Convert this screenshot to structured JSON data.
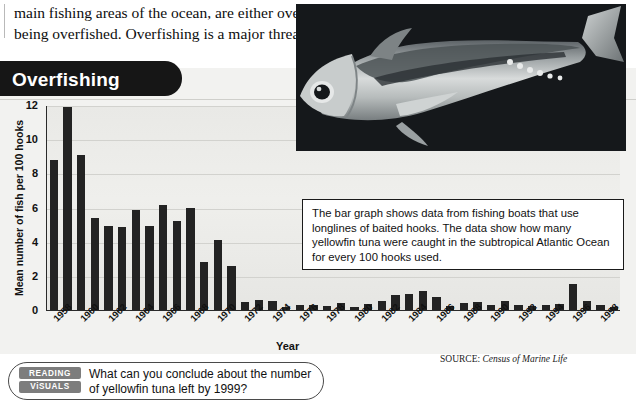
{
  "body_copy": {
    "line1": "main fishing areas of the ocean, are either overfished or very close to",
    "line2": "being overfished. Overfishing is a major threat to ocean environments."
  },
  "figure": {
    "title": "Overfishing",
    "callout": "The bar graph shows data from fishing boats that use longlines of baited hooks. The data show how many yellowfin tuna were caught in the subtropical Atlantic Ocean for every 100 hooks used.",
    "source_label": "SOURCE:",
    "source_value": "Census of Marine Life",
    "photo_alt": "yellowfin-tuna-photo"
  },
  "question": {
    "badge_line1": "READING",
    "badge_line2": "ViSUALS",
    "text": "What can you conclude about the number of yellowfin tuna left by 1999?"
  },
  "colors": {
    "bar": "#232323",
    "plot_bg": "#ebebe8",
    "tab": "#161616",
    "badge": "#7d7d7d"
  },
  "chart_data": {
    "type": "bar",
    "title": "Overfishing",
    "xlabel": "Year",
    "ylabel": "Mean number of fish per 100 hooks",
    "ylim": [
      0,
      12
    ],
    "yticks": [
      0,
      2,
      4,
      6,
      8,
      10,
      12
    ],
    "grid": true,
    "legend": null,
    "xtick_labels": [
      "1958",
      "1960",
      "1962",
      "1964",
      "1966",
      "1968",
      "1970",
      "1972",
      "1974",
      "1976",
      "1978",
      "1980",
      "1982",
      "1984",
      "1986",
      "1988",
      "1990",
      "1992",
      "1994",
      "1996",
      "1998"
    ],
    "categories": [
      "1958",
      "1959",
      "1960",
      "1961",
      "1962",
      "1963",
      "1964",
      "1965",
      "1966",
      "1967",
      "1968",
      "1969",
      "1970",
      "1971",
      "1972",
      "1973",
      "1974",
      "1975",
      "1976",
      "1977",
      "1978",
      "1979",
      "1980",
      "1981",
      "1982",
      "1983",
      "1984",
      "1985",
      "1986",
      "1987",
      "1988",
      "1989",
      "1990",
      "1991",
      "1992",
      "1993",
      "1994",
      "1995",
      "1996",
      "1997",
      "1998",
      "1999"
    ],
    "values": [
      8.8,
      11.9,
      9.1,
      5.4,
      4.9,
      4.85,
      5.85,
      4.9,
      6.15,
      5.2,
      5.95,
      2.8,
      4.1,
      2.6,
      0.45,
      0.6,
      0.55,
      0.15,
      0.3,
      0.3,
      0.25,
      0.4,
      0.2,
      0.35,
      0.5,
      0.9,
      0.95,
      1.1,
      0.75,
      0.25,
      0.4,
      0.45,
      0.3,
      0.5,
      0.3,
      0.25,
      0.3,
      0.35,
      1.55,
      0.55,
      0.3,
      0.15
    ]
  }
}
